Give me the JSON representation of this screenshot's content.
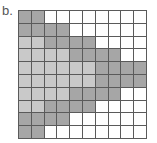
{
  "figure": {
    "label": "b.",
    "grid": {
      "rows": 10,
      "cols": 10,
      "legend": {
        "w": "white",
        "l": "light-gray",
        "d": "dark-gray"
      },
      "colors": {
        "white": "#ffffff",
        "light-gray": "#c9c9c9",
        "dark-gray": "#a6a6a6",
        "lines": "#5a5a5a"
      },
      "cells": [
        [
          "d",
          "d",
          "w",
          "w",
          "w",
          "w",
          "w",
          "w",
          "w",
          "w"
        ],
        [
          "d",
          "d",
          "d",
          "d",
          "w",
          "w",
          "w",
          "w",
          "w",
          "w"
        ],
        [
          "l",
          "l",
          "d",
          "d",
          "d",
          "d",
          "w",
          "w",
          "w",
          "w"
        ],
        [
          "l",
          "l",
          "l",
          "l",
          "d",
          "d",
          "d",
          "d",
          "w",
          "w"
        ],
        [
          "l",
          "l",
          "l",
          "l",
          "l",
          "l",
          "d",
          "d",
          "d",
          "d"
        ],
        [
          "l",
          "l",
          "l",
          "l",
          "l",
          "l",
          "d",
          "d",
          "d",
          "d"
        ],
        [
          "l",
          "l",
          "l",
          "l",
          "d",
          "d",
          "d",
          "d",
          "w",
          "w"
        ],
        [
          "l",
          "l",
          "d",
          "d",
          "d",
          "d",
          "w",
          "w",
          "w",
          "w"
        ],
        [
          "d",
          "d",
          "d",
          "d",
          "w",
          "w",
          "w",
          "w",
          "w",
          "w"
        ],
        [
          "d",
          "d",
          "w",
          "w",
          "w",
          "w",
          "w",
          "w",
          "w",
          "w"
        ]
      ]
    }
  }
}
